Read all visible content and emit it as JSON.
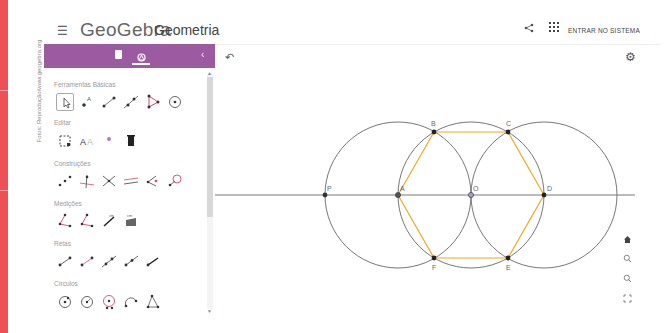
{
  "credit": "Fotos: Reprodução/www.geogebra.org",
  "header": {
    "menu_icon": "☰",
    "brand": "GeoGebra",
    "app_name": "Geometria",
    "share_icon": "share-icon",
    "apps_icon": "apps-grid-icon",
    "signin_label": "ENTRAR NO SISTEMA"
  },
  "panel": {
    "tabs": [
      {
        "name": "algebra",
        "icon": "document-icon"
      },
      {
        "name": "tools",
        "icon": "tools-icon",
        "active": true
      }
    ],
    "collapse_icon": "‹",
    "categories": [
      {
        "label": "Ferramentas Básicas",
        "tools": [
          "move",
          "point",
          "segment",
          "line",
          "polygon",
          "circle-center-point"
        ]
      },
      {
        "label": "Editar",
        "tools": [
          "select",
          "text-style",
          "show-hide",
          "delete"
        ]
      },
      {
        "label": "Construções",
        "tools": [
          "midpoint",
          "perpendicular",
          "angle-bisector",
          "parallel",
          "tangents",
          "locus"
        ]
      },
      {
        "label": "Medições",
        "tools": [
          "angle",
          "angle-given-size",
          "distance",
          "area"
        ]
      },
      {
        "label": "Retas",
        "tools": [
          "segment",
          "segment-given-length",
          "line",
          "ray",
          "vector"
        ]
      },
      {
        "label": "Círculos",
        "tools": [
          "circle-center-point",
          "circle-center-radius",
          "compass",
          "semicircle",
          "circle-three-points"
        ]
      }
    ]
  },
  "canvas": {
    "undo_icon": "↶",
    "settings_icon": "⚙",
    "nav": [
      {
        "name": "home",
        "icon": "🏠"
      },
      {
        "name": "zoom-in",
        "icon": "zoom-in-icon"
      },
      {
        "name": "zoom-out",
        "icon": "zoom-out-icon"
      },
      {
        "name": "fullscreen",
        "icon": "fullscreen-icon"
      }
    ],
    "points": [
      {
        "label": "P",
        "x": 110,
        "y": 150
      },
      {
        "label": "A",
        "x": 183,
        "y": 150
      },
      {
        "label": "O",
        "x": 256,
        "y": 150
      },
      {
        "label": "D",
        "x": 329,
        "y": 150
      },
      {
        "label": "B",
        "x": 219,
        "y": 87
      },
      {
        "label": "C",
        "x": 293,
        "y": 87
      },
      {
        "label": "F",
        "x": 219,
        "y": 213
      },
      {
        "label": "E",
        "x": 293,
        "y": 213
      }
    ],
    "circles": [
      {
        "center": "A",
        "cx": 183,
        "cy": 150,
        "r": 73
      },
      {
        "center": "O",
        "cx": 256,
        "cy": 150,
        "r": 73
      },
      {
        "center": "D",
        "cx": 329,
        "cy": 150,
        "r": 73
      }
    ],
    "hexagon": [
      "A",
      "B",
      "C",
      "D",
      "E",
      "F"
    ],
    "colors": {
      "hexagon": "#f5a623",
      "circle": "#666666",
      "line": "#555555",
      "point": "#333333"
    }
  }
}
